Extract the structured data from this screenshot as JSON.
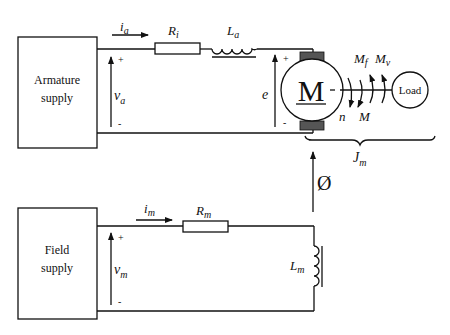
{
  "diagram": {
    "type": "dc-motor-equivalent-circuit",
    "armature_circuit": {
      "supply_label_line1": "Armature",
      "supply_label_line2": "supply",
      "current": {
        "symbol": "i",
        "sub": "a"
      },
      "voltage": {
        "symbol": "v",
        "sub": "a",
        "plus": "+",
        "minus": "-"
      },
      "resistor": {
        "symbol": "R",
        "sub": "i"
      },
      "inductor": {
        "symbol": "L",
        "sub": "a"
      },
      "emf": {
        "symbol": "e",
        "plus": "+",
        "minus": "-"
      }
    },
    "motor": {
      "label": "M",
      "speed": {
        "symbol": "n"
      },
      "torque": {
        "symbol": "M"
      },
      "friction_torque": {
        "symbol": "M",
        "sub": "f"
      },
      "viscous_torque": {
        "symbol": "M",
        "sub": "v"
      },
      "load_label": "Load",
      "inertia": {
        "symbol": "J",
        "sub": "m"
      }
    },
    "flux": {
      "symbol": "Ø"
    },
    "field_circuit": {
      "supply_label_line1": "Field",
      "supply_label_line2": "supply",
      "current": {
        "symbol": "i",
        "sub": "m"
      },
      "voltage": {
        "symbol": "v",
        "sub": "m",
        "plus": "+",
        "minus": "-"
      },
      "resistor": {
        "symbol": "R",
        "sub": "m"
      },
      "inductor": {
        "symbol": "L",
        "sub": "m"
      }
    }
  }
}
